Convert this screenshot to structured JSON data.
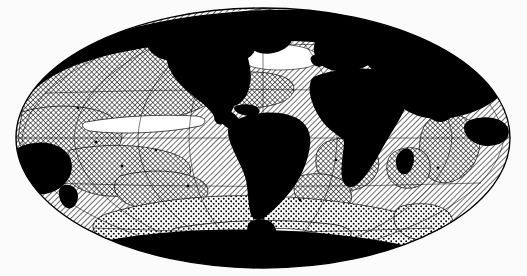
{
  "figure": {
    "kind": "world-map",
    "projection": "Mollweide",
    "title": "",
    "caption": "",
    "background_color": "#fbfbfb",
    "ink_color": "#000000",
    "paper_color": "#ffffff"
  },
  "map": {
    "ellipse": {
      "center_x": 263,
      "center_y": 138,
      "radius_x": 247,
      "radius_y": 130,
      "outline_color": "#000000",
      "outline_width": 1.2
    },
    "graticule": {
      "visible": true,
      "meridian_interval_deg": 30,
      "parallel_interval_deg": 30,
      "line_color": "#000000",
      "line_width": 0.5,
      "central_meridian_deg": -30
    },
    "land": {
      "fill": "solid-black",
      "fill_color": "#000000",
      "coast_margin": "white",
      "regions": [
        "North America",
        "South America",
        "Greenland",
        "Europe",
        "Africa",
        "Asia",
        "Australia",
        "Antarctica",
        "Madagascar",
        "New Zealand",
        "Japan",
        "Indonesia",
        "British Isles",
        "Iceland"
      ]
    },
    "ocean_patterns": [
      {
        "id": "pattern-diagonal-hatch",
        "name": "diagonal-hatch",
        "label": "diagonal hatch",
        "color": "#000000",
        "spacing_px": 4,
        "angle_deg": 45
      },
      {
        "id": "pattern-crosshatch",
        "name": "crosshatch",
        "label": "cross hatch",
        "color": "#000000",
        "spacing_px": 4,
        "angle_deg": 45
      },
      {
        "id": "pattern-stipple",
        "name": "stipple",
        "label": "stipple / dots",
        "color": "#000000",
        "spacing_px": 5,
        "dot_radius_px": 0.9
      },
      {
        "id": "pattern-blank",
        "name": "blank",
        "label": "unpatterned",
        "color": "#ffffff"
      }
    ]
  }
}
